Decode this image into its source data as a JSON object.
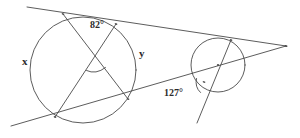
{
  "figure": {
    "type": "geometry-diagram",
    "width": 300,
    "height": 138,
    "background_color": "#ffffff",
    "stroke_color": "#4a4a4a",
    "text_color": "#2b2b2b"
  },
  "labels": {
    "arc_x": "x",
    "arc_y": "y",
    "angle_inscribed": "82°",
    "angle_secant": "127°"
  },
  "shapes": {
    "large_circle": {
      "name": "large-circle",
      "cx": 83,
      "cy": 70,
      "r": 53
    },
    "small_circle": {
      "name": "small-circle",
      "cx": 218,
      "cy": 65,
      "r": 27
    },
    "center_dot": {
      "name": "small-circle-center-dot",
      "cx": 218,
      "cy": 65,
      "r": 1.1
    }
  },
  "lines": [
    {
      "name": "upper-secant-line",
      "x1": 27,
      "y1": 7,
      "x2": 286,
      "y2": 46
    },
    {
      "name": "lower-secant-line",
      "x1": 11,
      "y1": 126,
      "x2": 286,
      "y2": 46
    },
    {
      "name": "steep-chord-line",
      "x1": 231,
      "y1": 40,
      "x2": 197,
      "y2": 123
    },
    {
      "name": "chord-top-left-to-bottom-right",
      "x1": 63,
      "y1": 14,
      "x2": 128,
      "y2": 99
    },
    {
      "name": "chord-top-right-to-bottom-left",
      "x1": 116,
      "y1": 24,
      "x2": 55,
      "y2": 117
    }
  ],
  "points": [
    {
      "name": "vertex-apex-right",
      "x": 286,
      "y": 46
    },
    {
      "name": "intersection-top-left",
      "x": 63,
      "y": 14
    },
    {
      "name": "intersection-top-right",
      "x": 116,
      "y": 24
    },
    {
      "name": "intersection-bottom-left",
      "x": 55,
      "y": 117
    },
    {
      "name": "intersection-bottom-right",
      "x": 128,
      "y": 99
    },
    {
      "name": "chord-crossing-point",
      "x": 96,
      "y": 56
    },
    {
      "name": "small-circle-tangent-point",
      "x": 231,
      "y": 40
    },
    {
      "name": "small-circle-secant-point",
      "x": 204,
      "y": 82
    }
  ],
  "angle_marks": [
    {
      "name": "angle-arc-82",
      "cx": 96,
      "cy": 56,
      "r": 15
    },
    {
      "name": "angle-arc-127",
      "cx": 204,
      "cy": 82,
      "r": 11
    }
  ]
}
